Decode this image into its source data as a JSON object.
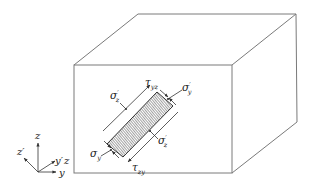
{
  "diagram": {
    "type": "stress-element-in-block",
    "colors": {
      "stroke": "#7a7a7a",
      "ink": "#222222",
      "hatch": "#555555",
      "background": "#ffffff"
    },
    "block": {
      "front_face": {
        "x1": 74,
        "y1": 65,
        "x2": 232,
        "y2": 173
      },
      "back_top_left": [
        138,
        14
      ],
      "back_top_right": [
        296,
        14
      ],
      "back_bottom_right": [
        297,
        122
      ]
    },
    "element": {
      "corners": [
        [
          157,
          92
        ],
        [
          173,
          106
        ],
        [
          123,
          157
        ],
        [
          107,
          144
        ]
      ],
      "hatched": true
    },
    "labels": {
      "sigma_z_prime_top": {
        "base": "σ",
        "sub": "z",
        "prime": "′"
      },
      "tau_yz": {
        "base": "τ",
        "sub": "yz"
      },
      "sigma_y_prime": {
        "base": "σ",
        "sub": "y",
        "prime": "′"
      },
      "sigma_y": {
        "base": "σ",
        "sub": "y"
      },
      "tau_zy": {
        "base": "τ",
        "sub": "zy"
      },
      "sigma_z_prime_bottom": {
        "base": "σ",
        "sub": "z",
        "prime": "′"
      }
    },
    "axes": {
      "z": "z",
      "z_prime": "z′",
      "y_prime": "y′",
      "z_small": "z",
      "y": "y"
    }
  }
}
